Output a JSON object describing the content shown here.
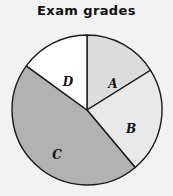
{
  "chart_data": {
    "type": "pie",
    "title": "Exam grades",
    "categories": [
      "A",
      "B",
      "C",
      "D"
    ],
    "values": [
      16,
      23,
      46,
      15
    ],
    "unit": "percent",
    "start_angle_deg": 0,
    "direction": "clockwise",
    "slices": [
      {
        "label": "A",
        "value": 16,
        "start_angle_deg": 0,
        "end_angle_deg": 58,
        "color": "#dcdcdc",
        "label_x": 113,
        "label_y": 62
      },
      {
        "label": "B",
        "value": 23,
        "start_angle_deg": 58,
        "end_angle_deg": 140,
        "color": "#e9e9e9",
        "label_x": 131,
        "label_y": 107
      },
      {
        "label": "C",
        "value": 46,
        "start_angle_deg": 140,
        "end_angle_deg": 306,
        "color": "#b2b2b2",
        "label_x": 57,
        "label_y": 133
      },
      {
        "label": "D",
        "value": 15,
        "start_angle_deg": 306,
        "end_angle_deg": 360,
        "color": "#ffffff",
        "label_x": 68,
        "label_y": 60
      }
    ],
    "outline_color": "#1a1a1a",
    "background_color": "#f2f2f2",
    "legend": "none",
    "grid": false,
    "xlabel": "",
    "ylabel": ""
  },
  "geometry": {
    "center_x": 87,
    "center_y": 88,
    "radius": 75
  }
}
